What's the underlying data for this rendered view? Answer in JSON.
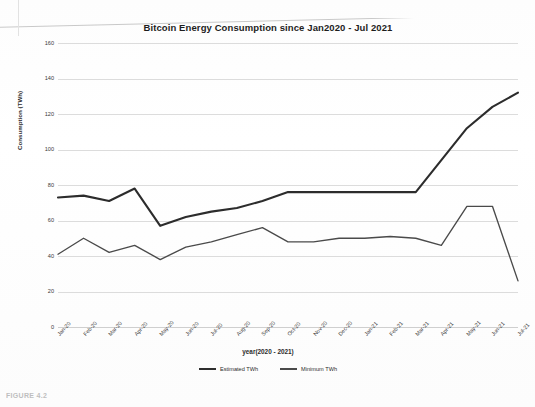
{
  "chart_data": {
    "type": "line",
    "title": "Bitcoin Energy Consumption since Jan2020 - Jul 2021",
    "xlabel": "year(2020 - 2021)",
    "ylabel": "Consumption (TWh)",
    "categories": [
      "Jan-20",
      "Feb-20",
      "Mar-20",
      "Apr-20",
      "May-20",
      "Jun-20",
      "Jul-20",
      "Aug-20",
      "Sep-20",
      "Oct-20",
      "Nov-20",
      "Dec-20",
      "Jan-21",
      "Feb-21",
      "Mar-21",
      "Apr-21",
      "May-21",
      "Jun-21",
      "Jul-21"
    ],
    "series": [
      {
        "name": "Estimated TWh",
        "values": [
          73,
          74,
          71,
          78,
          57,
          62,
          65,
          67,
          71,
          76,
          76,
          76,
          76,
          76,
          76,
          94,
          112,
          124,
          132
        ]
      },
      {
        "name": "Minimum TWh",
        "values": [
          41,
          50,
          42,
          46,
          38,
          45,
          48,
          52,
          56,
          48,
          48,
          50,
          50,
          51,
          50,
          46,
          68,
          68,
          26
        ]
      }
    ],
    "ylim": [
      0,
      160
    ],
    "yticks": [
      0,
      20,
      40,
      60,
      80,
      100,
      120,
      140,
      160
    ],
    "grid": true,
    "legend_position": "bottom"
  },
  "legend": {
    "estimated_label": "Estimated TWh",
    "minimum_label": "Minimum TWh"
  },
  "page": {
    "caption": "FIGURE 4.2"
  }
}
